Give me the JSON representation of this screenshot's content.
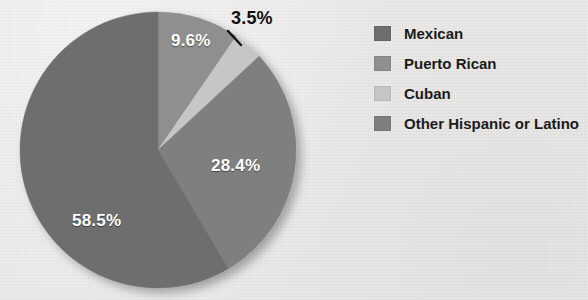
{
  "background_color": "#edebe9",
  "chart_data": {
    "type": "pie",
    "title": "",
    "subtitle": "",
    "xlabel": "",
    "ylabel": "",
    "legend_position": "right",
    "grid": false,
    "units": "percent",
    "start_angle_deg": 0,
    "direction": "clockwise",
    "categories": [
      "Mexican",
      "Puerto Rican",
      "Cuban",
      "Other Hispanic or Latino"
    ],
    "values": [
      58.5,
      9.6,
      3.5,
      28.4
    ],
    "labels": [
      "58.5%",
      "9.6%",
      "3.5%",
      "28.4%"
    ],
    "colors": [
      "#6e6e6e",
      "#8f8f8f",
      "#c6c6c6",
      "#7f7f7f"
    ],
    "slices": [
      {
        "name": "Puerto Rican",
        "value": 9.6,
        "label": "9.6%",
        "color": "#8f8f8f",
        "label_placement": "inside",
        "label_color": "#ffffff",
        "start_deg": 0,
        "end_deg": 34.56
      },
      {
        "name": "Cuban",
        "value": 3.5,
        "label": "3.5%",
        "color": "#c6c6c6",
        "label_placement": "outside",
        "label_color": "#111111",
        "leader_line": true,
        "start_deg": 34.56,
        "end_deg": 47.16
      },
      {
        "name": "Other Hispanic or Latino",
        "value": 28.4,
        "label": "28.4%",
        "color": "#7f7f7f",
        "label_placement": "inside",
        "label_color": "#ffffff",
        "start_deg": 47.16,
        "end_deg": 149.4
      },
      {
        "name": "Mexican",
        "value": 58.5,
        "label": "58.5%",
        "color": "#6e6e6e",
        "label_placement": "inside",
        "label_color": "#ffffff",
        "start_deg": 149.4,
        "end_deg": 360
      }
    ]
  },
  "legend": {
    "items": [
      {
        "label": "Mexican",
        "color": "#6e6e6e"
      },
      {
        "label": "Puerto Rican",
        "color": "#8f8f8f"
      },
      {
        "label": "Cuban",
        "color": "#c6c6c6"
      },
      {
        "label": "Other Hispanic or Latino",
        "color": "#7f7f7f"
      }
    ]
  }
}
